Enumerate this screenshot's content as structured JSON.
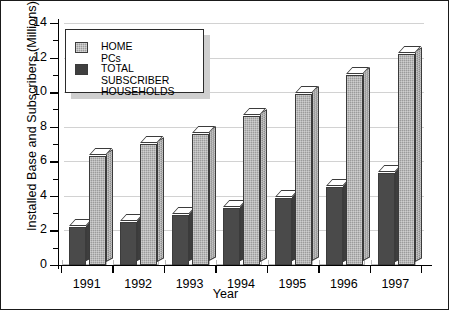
{
  "chart_data": {
    "type": "bar",
    "title": "",
    "xlabel": "Year",
    "ylabel": "Installed Base and Subscribers (Millions)",
    "categories": [
      "1991",
      "1992",
      "1993",
      "1994",
      "1995",
      "1996",
      "1997"
    ],
    "series": [
      {
        "name": "TOTAL SUBSCRIBER HOUSEHOLDS",
        "color": "#4a4a4a",
        "values": [
          2.2,
          2.5,
          2.9,
          3.3,
          3.9,
          4.5,
          5.3
        ]
      },
      {
        "name": "HOME PCs",
        "color": "#9b9b9b",
        "values": [
          6.3,
          7.0,
          7.6,
          8.6,
          9.9,
          11.0,
          12.2
        ]
      }
    ],
    "ylim": [
      0,
      14
    ],
    "ytick_major": [
      0,
      2,
      4,
      6,
      8,
      10,
      12,
      14
    ],
    "ytick_minor_step": 1,
    "ytick_labels": [
      "0",
      "2",
      "4",
      "6",
      "8",
      "10",
      "12",
      "14"
    ],
    "grid": "horizontal-major-only",
    "legend_position": "upper-left-inside",
    "style_3d": true
  },
  "legend": {
    "entries": [
      {
        "label": "HOME PCs",
        "swatch": "light"
      },
      {
        "label": "TOTAL SUBSCRIBER\nHOUSEHOLDS",
        "swatch": "dark"
      }
    ]
  }
}
